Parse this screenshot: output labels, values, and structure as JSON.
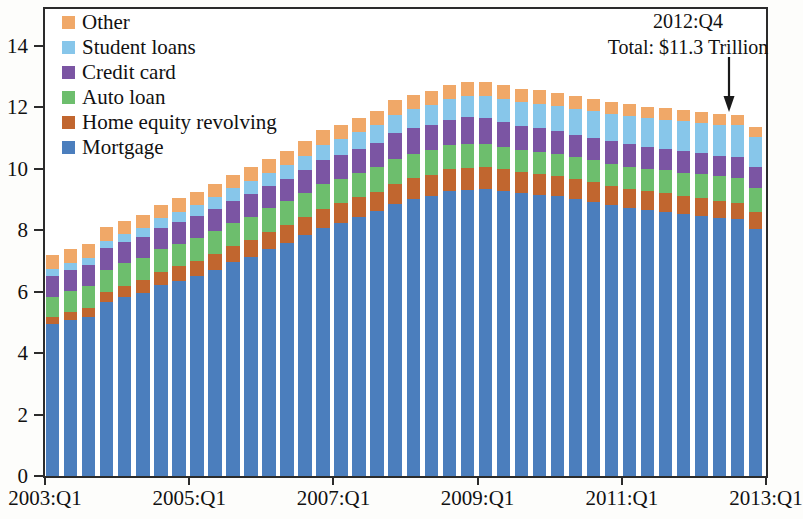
{
  "chart_data": {
    "type": "bar",
    "stacked": true,
    "title": "",
    "subtitle": "",
    "xlabel": "",
    "ylabel": "",
    "ylim": [
      0,
      15.2
    ],
    "ytick_labels": [
      "0",
      "2",
      "4",
      "6",
      "8",
      "10",
      "12",
      "14"
    ],
    "ytick_values": [
      0,
      2,
      4,
      6,
      8,
      10,
      12,
      14
    ],
    "xtick_labels": [
      "2003:Q1",
      "2005:Q1",
      "2007:Q1",
      "2009:Q1",
      "2011:Q1",
      "2013:Q1"
    ],
    "xtick_quarters": [
      0,
      8,
      16,
      24,
      32,
      40
    ],
    "grid": false,
    "legend_position": "top-left",
    "units": "Trillions of Dollars",
    "categories": [
      "2003:Q1",
      "2003:Q2",
      "2003:Q3",
      "2003:Q4",
      "2004:Q1",
      "2004:Q2",
      "2004:Q3",
      "2004:Q4",
      "2005:Q1",
      "2005:Q2",
      "2005:Q3",
      "2005:Q4",
      "2006:Q1",
      "2006:Q2",
      "2006:Q3",
      "2006:Q4",
      "2007:Q1",
      "2007:Q2",
      "2007:Q3",
      "2007:Q4",
      "2008:Q1",
      "2008:Q2",
      "2008:Q3",
      "2008:Q4",
      "2009:Q1",
      "2009:Q2",
      "2009:Q3",
      "2009:Q4",
      "2010:Q1",
      "2010:Q2",
      "2010:Q3",
      "2010:Q4",
      "2011:Q1",
      "2011:Q2",
      "2011:Q3",
      "2011:Q4",
      "2012:Q1",
      "2012:Q2",
      "2012:Q3",
      "2012:Q4"
    ],
    "series": [
      {
        "name": "Mortgage",
        "color": "#4B7EBD",
        "values": [
          4.94,
          5.08,
          5.18,
          5.66,
          5.84,
          5.97,
          6.21,
          6.36,
          6.51,
          6.71,
          6.95,
          7.13,
          7.38,
          7.59,
          7.83,
          8.08,
          8.25,
          8.43,
          8.61,
          8.86,
          9.02,
          9.12,
          9.29,
          9.32,
          9.35,
          9.28,
          9.2,
          9.15,
          9.1,
          9.02,
          8.93,
          8.82,
          8.73,
          8.66,
          8.6,
          8.52,
          8.47,
          8.4,
          8.35,
          8.03
        ]
      },
      {
        "name": "Home equity revolving",
        "color": "#C1662F",
        "values": [
          0.24,
          0.26,
          0.29,
          0.33,
          0.36,
          0.4,
          0.44,
          0.47,
          0.5,
          0.53,
          0.55,
          0.56,
          0.57,
          0.58,
          0.6,
          0.62,
          0.63,
          0.64,
          0.65,
          0.66,
          0.67,
          0.68,
          0.69,
          0.7,
          0.71,
          0.7,
          0.69,
          0.68,
          0.67,
          0.65,
          0.64,
          0.63,
          0.62,
          0.61,
          0.6,
          0.58,
          0.57,
          0.56,
          0.55,
          0.56
        ]
      },
      {
        "name": "Auto loan",
        "color": "#6DBE6D",
        "values": [
          0.64,
          0.67,
          0.7,
          0.72,
          0.72,
          0.73,
          0.73,
          0.73,
          0.73,
          0.74,
          0.75,
          0.75,
          0.76,
          0.77,
          0.79,
          0.8,
          0.8,
          0.8,
          0.8,
          0.81,
          0.8,
          0.8,
          0.79,
          0.78,
          0.76,
          0.74,
          0.72,
          0.71,
          0.7,
          0.7,
          0.71,
          0.71,
          0.72,
          0.73,
          0.75,
          0.77,
          0.78,
          0.79,
          0.8,
          0.78
        ]
      },
      {
        "name": "Credit card",
        "color": "#7B55A3",
        "values": [
          0.69,
          0.69,
          0.69,
          0.7,
          0.69,
          0.69,
          0.7,
          0.72,
          0.72,
          0.71,
          0.71,
          0.73,
          0.72,
          0.72,
          0.73,
          0.78,
          0.77,
          0.78,
          0.79,
          0.84,
          0.83,
          0.83,
          0.83,
          0.87,
          0.83,
          0.8,
          0.78,
          0.78,
          0.75,
          0.73,
          0.73,
          0.75,
          0.73,
          0.7,
          0.69,
          0.7,
          0.68,
          0.67,
          0.67,
          0.68
        ]
      },
      {
        "name": "Student loans",
        "color": "#87C6EA",
        "values": [
          0.24,
          0.25,
          0.25,
          0.25,
          0.26,
          0.28,
          0.31,
          0.33,
          0.36,
          0.38,
          0.4,
          0.42,
          0.44,
          0.46,
          0.48,
          0.5,
          0.52,
          0.54,
          0.56,
          0.59,
          0.61,
          0.64,
          0.67,
          0.7,
          0.73,
          0.76,
          0.78,
          0.8,
          0.82,
          0.85,
          0.87,
          0.89,
          0.92,
          0.94,
          0.96,
          0.98,
          1.0,
          1.02,
          1.04,
          0.97
        ]
      },
      {
        "name": "Other",
        "color": "#F0A868",
        "values": [
          0.44,
          0.45,
          0.45,
          0.45,
          0.44,
          0.44,
          0.44,
          0.44,
          0.44,
          0.45,
          0.45,
          0.46,
          0.46,
          0.46,
          0.47,
          0.47,
          0.47,
          0.47,
          0.48,
          0.48,
          0.48,
          0.47,
          0.47,
          0.47,
          0.46,
          0.45,
          0.44,
          0.43,
          0.42,
          0.41,
          0.4,
          0.39,
          0.38,
          0.37,
          0.37,
          0.36,
          0.36,
          0.35,
          0.35,
          0.35
        ]
      }
    ]
  },
  "legend": {
    "items": [
      {
        "label": "Other",
        "color": "#F0A868"
      },
      {
        "label": "Student loans",
        "color": "#87C6EA"
      },
      {
        "label": "Credit card",
        "color": "#7B55A3"
      },
      {
        "label": "Auto loan",
        "color": "#6DBE6D"
      },
      {
        "label": "Home equity revolving",
        "color": "#C1662F"
      },
      {
        "label": "Mortgage",
        "color": "#4B7EBD"
      }
    ]
  },
  "annotation": {
    "line1": "2012:Q4",
    "line2": "Total: $11.3 Trillion"
  }
}
